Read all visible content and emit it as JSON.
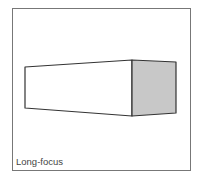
{
  "figure": {
    "label": "Long-focus",
    "colors": {
      "frame": "#777777",
      "outline": "#333333",
      "front_face": "#ffffff",
      "end_face": "#c8c8c8"
    },
    "shape": "rectangular prism in perspective (long-focus view)"
  }
}
